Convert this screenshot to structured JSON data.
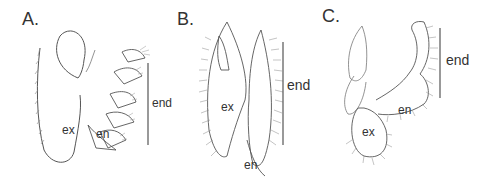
{
  "figure": {
    "panels": [
      {
        "id": "A",
        "label": "A.",
        "parts": {
          "ex": "ex",
          "en": "en"
        },
        "scale_label": "end"
      },
      {
        "id": "B",
        "label": "B.",
        "parts": {
          "ex": "ex",
          "en": "en"
        },
        "scale_label": "end"
      },
      {
        "id": "C",
        "label": "C.",
        "parts": {
          "ex": "ex",
          "en": "en"
        },
        "scale_label": "end"
      }
    ],
    "colors": {
      "line": "#555555",
      "text": "#333333",
      "background": "#ffffff"
    }
  }
}
